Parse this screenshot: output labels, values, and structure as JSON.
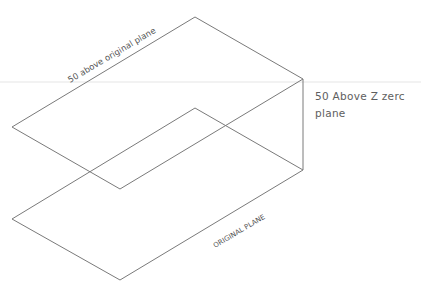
{
  "diagram": {
    "type": "isometric-planes",
    "colors": {
      "line": "#7a7a7a",
      "text": "#555555",
      "background": "#ffffff"
    },
    "labels": {
      "upper_plane": "50 above original plane",
      "lower_plane": "ORIGINAL PLANE",
      "offset_line1": "50 Above Z zerc",
      "offset_line2": "plane"
    },
    "upper_plane": {
      "name": "50 above original plane",
      "vertices": [
        [
          195,
          17
        ],
        [
          303,
          79
        ],
        [
          120,
          189
        ],
        [
          12,
          127
        ]
      ]
    },
    "lower_plane": {
      "name": "ORIGINAL PLANE",
      "vertices": [
        [
          195,
          108
        ],
        [
          303,
          170
        ],
        [
          120,
          280
        ],
        [
          12,
          219
        ]
      ]
    },
    "vertical_edge": {
      "from": [
        303,
        79
      ],
      "to": [
        303,
        170
      ]
    }
  }
}
